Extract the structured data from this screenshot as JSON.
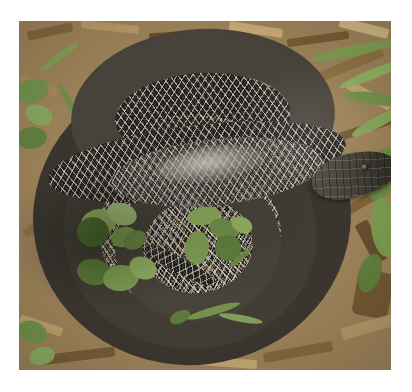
{
  "page": {
    "background_color": "#ffffff",
    "width": 412,
    "height": 392,
    "top_mark": "·"
  },
  "figure": {
    "type": "photograph",
    "frame": {
      "x": 19,
      "y": 21,
      "width": 372,
      "height": 349
    },
    "border_color": "#ffffff"
  },
  "scene": {
    "subject_label": "coiled-snake",
    "subject_description": "Dark brown-black snake with light-edged diamond scale pattern, body coiled into several overlapping rings, head resting at the right side",
    "background_label": "wood-chip mulch ground",
    "lighting": "bright overhead daylight with specular gleam on mid-body"
  },
  "colors": {
    "snake_dark": "#3a362f",
    "snake_mid": "#474339",
    "snake_light": "#6e6a60",
    "snake_gleam": "#d6d4cc",
    "scale_edge_light": "#ece8de",
    "scale_edge_dark": "#0a0a0a",
    "head_dark": "#2a2722",
    "mulch_light": "#d8c198",
    "mulch_mid": "#a88a5c",
    "mulch_dark": "#8b7348",
    "wood_chip": "#6b5230",
    "leaf_green": "#6f8f4a",
    "leaf_green_dark": "#4a6b2e",
    "grass_green": "#8aa857",
    "page_white": "#ffffff"
  },
  "elements": {
    "coils": [
      {
        "name": "coil-outer",
        "note": "largest outer ring of the coiled body"
      },
      {
        "name": "coil-mid",
        "note": "middle ring inside the outer coil"
      },
      {
        "name": "coil-inner",
        "note": "innermost small ring"
      },
      {
        "name": "coil-top",
        "note": "upper arch looping over the other coils"
      },
      {
        "name": "body-neck",
        "note": "long diagonal body section leading to the head"
      },
      {
        "name": "tail",
        "note": "tail tip emerging near the lower middle"
      }
    ],
    "head": {
      "name": "snake-head",
      "position": "right-center",
      "eye_visible": true
    },
    "foliage": [
      {
        "name": "leaf-cluster-left",
        "note": "round green leaves lower-left of center"
      },
      {
        "name": "leaf-cluster-center",
        "note": "small green leaves in the central opening"
      },
      {
        "name": "grass-blades-right",
        "note": "long green grass blades along the right edge"
      },
      {
        "name": "leaf-upper-left",
        "note": "green leaves in the upper-left corner"
      }
    ]
  }
}
